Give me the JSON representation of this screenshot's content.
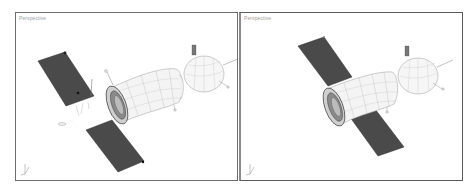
{
  "viewports": [
    {
      "id": "left",
      "label": "Perspective",
      "description": "Exploded view: spacecraft body with two solar panels detached"
    },
    {
      "id": "right",
      "label": "Perspective",
      "description": "Assembled view: spacecraft body with solar panels attached"
    }
  ],
  "colors": {
    "panel": "#4a4a4a",
    "hull": "#f4f4f4",
    "wire": "#9a9a9a",
    "border": "#6e6e6e",
    "label": "#a0a0a0"
  }
}
